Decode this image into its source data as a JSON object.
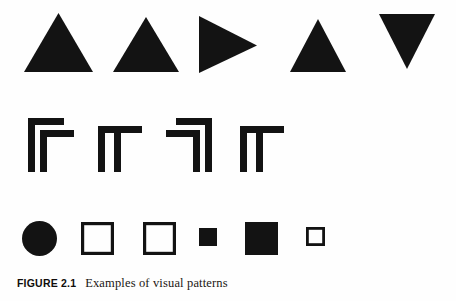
{
  "figure": {
    "caption_label": "FIGURE 2.1",
    "caption_text": "Examples of visual patterns",
    "background_color": "#fefefe",
    "ink_color": "#131313"
  },
  "rows": [
    {
      "name": "triangles-row",
      "shapes": [
        {
          "name": "triangle-up-1",
          "glyph": "triangle-up",
          "fill": "solid",
          "label": "upward triangle"
        },
        {
          "name": "triangle-up-2",
          "glyph": "triangle-up",
          "fill": "solid",
          "label": "upward triangle"
        },
        {
          "name": "triangle-right-1",
          "glyph": "triangle-right",
          "fill": "solid",
          "label": "rightward triangle"
        },
        {
          "name": "triangle-up-3",
          "glyph": "triangle-up",
          "fill": "solid",
          "label": "upward triangle"
        },
        {
          "name": "triangle-down-1",
          "glyph": "triangle-down",
          "fill": "solid",
          "label": "downward triangle"
        }
      ]
    },
    {
      "name": "angular-row",
      "shapes": [
        {
          "name": "nested-gamma-left",
          "glyph": "nested-gamma-left",
          "fill": "solid",
          "label": "nested left corner bracket"
        },
        {
          "name": "double-stem-left",
          "glyph": "double-stem-left",
          "fill": "solid",
          "label": "double stem with left bar"
        },
        {
          "name": "nested-gamma-right",
          "glyph": "nested-gamma-right",
          "fill": "solid",
          "label": "nested right corner bracket"
        },
        {
          "name": "double-stem-right",
          "glyph": "double-stem-right",
          "fill": "solid",
          "label": "double stem with right bar"
        }
      ]
    },
    {
      "name": "blobs-row",
      "shapes": [
        {
          "name": "circle-filled",
          "glyph": "circle",
          "fill": "solid",
          "label": "filled circle"
        },
        {
          "name": "square-outline-1",
          "glyph": "square",
          "fill": "outline",
          "label": "outlined square"
        },
        {
          "name": "square-outline-2",
          "glyph": "square",
          "fill": "outline",
          "label": "outlined square"
        },
        {
          "name": "square-filled-small",
          "glyph": "square",
          "fill": "solid",
          "label": "small filled square"
        },
        {
          "name": "square-filled-large",
          "glyph": "square",
          "fill": "solid",
          "label": "large filled square"
        },
        {
          "name": "square-outline-tiny",
          "glyph": "square",
          "fill": "outline",
          "label": "tiny outlined square"
        }
      ]
    }
  ]
}
